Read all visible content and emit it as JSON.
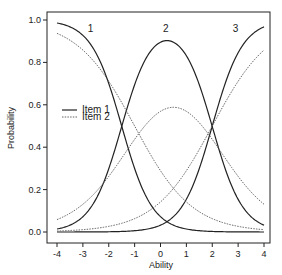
{
  "chart_data": {
    "type": "line",
    "title": "",
    "xlabel": "Ability",
    "ylabel": "Probability",
    "xlim": [
      -4,
      4
    ],
    "ylim": [
      0,
      1
    ],
    "xticks": [
      -4,
      -3,
      -2,
      -1,
      0,
      1,
      2,
      3,
      4
    ],
    "yticks": [
      "0.0",
      "0.2",
      "0.4",
      "0.6",
      "0.8",
      "1.0"
    ],
    "grid": false,
    "legend": {
      "position": "left-middle",
      "entries": [
        {
          "label": "Item 1",
          "style": "solid"
        },
        {
          "label": "Item 2",
          "style": "dotted"
        }
      ]
    },
    "annotations": [
      {
        "text": "1",
        "x": -2.7,
        "y": 0.96
      },
      {
        "text": "2",
        "x": 0.2,
        "y": 0.96
      },
      {
        "text": "3",
        "x": 2.9,
        "y": 0.96
      }
    ],
    "x": [
      -4,
      -3,
      -2,
      -1,
      0,
      1,
      2,
      3,
      4
    ],
    "series": [
      {
        "name": "Item 1 - Category 1",
        "style": "solid",
        "values": [
          0.986,
          0.93,
          0.7,
          0.3,
          0.07,
          0.013,
          0.003,
          0.0,
          0.0
        ]
      },
      {
        "name": "Item 1 - Category 2",
        "style": "solid",
        "values": [
          0.014,
          0.07,
          0.3,
          0.7,
          0.9,
          0.83,
          0.5,
          0.15,
          0.03
        ]
      },
      {
        "name": "Item 1 - Category 3",
        "style": "solid",
        "values": [
          0.0,
          0.0,
          0.0,
          0.003,
          0.03,
          0.15,
          0.5,
          0.85,
          0.97
        ]
      },
      {
        "name": "Item 2 - Category 1",
        "style": "dotted",
        "values": [
          0.94,
          0.86,
          0.71,
          0.5,
          0.29,
          0.14,
          0.06,
          0.03,
          0.01
        ]
      },
      {
        "name": "Item 2 - Category 2",
        "style": "dotted",
        "values": [
          0.06,
          0.14,
          0.28,
          0.47,
          0.57,
          0.57,
          0.44,
          0.26,
          0.13
        ]
      },
      {
        "name": "Item 2 - Category 3",
        "style": "dotted",
        "values": [
          0.0,
          0.0,
          0.01,
          0.03,
          0.14,
          0.29,
          0.5,
          0.71,
          0.86
        ]
      }
    ],
    "model": {
      "item1": {
        "a": 1.7,
        "b": [
          -1.5,
          2.0
        ]
      },
      "item2": {
        "a": 0.9,
        "b": [
          -1.0,
          2.0
        ]
      }
    }
  }
}
